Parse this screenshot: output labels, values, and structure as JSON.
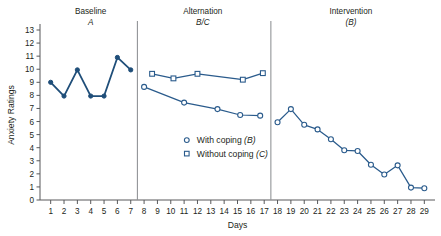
{
  "chart_data": {
    "type": "line",
    "title": "",
    "xlabel": "Days",
    "ylabel": "Anxiety Ratings",
    "ylim": [
      0,
      13
    ],
    "xlim": [
      0.2,
      29.8
    ],
    "yticks": [
      0,
      1,
      2,
      3,
      4,
      5,
      6,
      7,
      8,
      9,
      10,
      11,
      12,
      13
    ],
    "xticks": [
      1,
      2,
      3,
      4,
      5,
      6,
      7,
      8,
      9,
      10,
      11,
      12,
      13,
      14,
      15,
      16,
      17,
      18,
      19,
      20,
      21,
      22,
      23,
      24,
      25,
      26,
      27,
      28,
      29
    ],
    "grid": false,
    "legend_position": "center",
    "phases": [
      {
        "name": "Baseline",
        "condition": "A",
        "center_day": 4.0
      },
      {
        "name": "Alternation",
        "condition": "B/C",
        "center_day": 12.4
      },
      {
        "name": "Intervention",
        "condition": "(B)",
        "center_day": 23.5
      }
    ],
    "phase_separators": [
      7.5,
      17.5
    ],
    "series": [
      {
        "name": "Baseline",
        "marker": "filled-circle",
        "points": [
          {
            "x": 1,
            "y": 9.0
          },
          {
            "x": 2,
            "y": 7.95
          },
          {
            "x": 3,
            "y": 9.95
          },
          {
            "x": 4,
            "y": 7.95
          },
          {
            "x": 5,
            "y": 7.95
          },
          {
            "x": 6,
            "y": 10.9
          },
          {
            "x": 7,
            "y": 9.95
          }
        ]
      },
      {
        "name": "With coping (B)",
        "marker": "open-circle",
        "points": [
          {
            "x": 8.0,
            "y": 8.65
          },
          {
            "x": 11.0,
            "y": 7.45
          },
          {
            "x": 13.5,
            "y": 6.95
          },
          {
            "x": 15.2,
            "y": 6.5
          },
          {
            "x": 16.7,
            "y": 6.45
          }
        ]
      },
      {
        "name": "Without coping (C)",
        "marker": "open-square",
        "points": [
          {
            "x": 8.6,
            "y": 9.65
          },
          {
            "x": 10.2,
            "y": 9.3
          },
          {
            "x": 12.0,
            "y": 9.65
          },
          {
            "x": 15.4,
            "y": 9.2
          },
          {
            "x": 16.9,
            "y": 9.7
          }
        ]
      },
      {
        "name": "Intervention",
        "marker": "open-circle",
        "points": [
          {
            "x": 18,
            "y": 5.95
          },
          {
            "x": 19,
            "y": 6.95
          },
          {
            "x": 20,
            "y": 5.75
          },
          {
            "x": 21,
            "y": 5.4
          },
          {
            "x": 22,
            "y": 4.65
          },
          {
            "x": 23,
            "y": 3.8
          },
          {
            "x": 24,
            "y": 3.75
          },
          {
            "x": 25,
            "y": 2.7
          },
          {
            "x": 26,
            "y": 1.95
          },
          {
            "x": 27,
            "y": 2.65
          },
          {
            "x": 28,
            "y": 0.95
          },
          {
            "x": 29,
            "y": 0.9
          }
        ]
      }
    ],
    "legend": [
      {
        "label_main": "With coping",
        "label_code": "(B)",
        "marker": "open-circle"
      },
      {
        "label_main": "Without coping",
        "label_code": "(C)",
        "marker": "open-square"
      }
    ],
    "colors": {
      "series_line": "#2a5b8c",
      "baseline_line": "#1f4e79",
      "axis": "#58595b",
      "separator": "#939598",
      "text": "#231f20",
      "background": "#ffffff"
    }
  }
}
